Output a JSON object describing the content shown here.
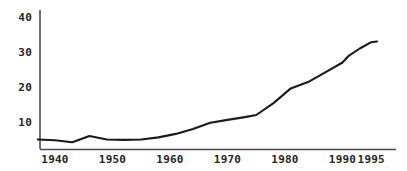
{
  "chart_data": {
    "type": "line",
    "title": "",
    "subtitle": "",
    "xlabel": "",
    "ylabel": "",
    "xlim": [
      1937,
      1997
    ],
    "ylim": [
      0,
      43
    ],
    "grid": false,
    "legend": null,
    "legend_position": "none",
    "line_color": "#1a1a1a",
    "axis_color": "#4a4a52",
    "background_color": "#ffffff",
    "x_ticks": [
      1940,
      1950,
      1960,
      1970,
      1980,
      1990,
      1995
    ],
    "x_tick_labels": [
      "1940",
      "1950",
      "1960",
      "1970",
      "1980",
      "1990",
      "1995"
    ],
    "y_ticks": [
      10,
      20,
      30,
      40
    ],
    "y_tick_labels": [
      "10",
      "20",
      "30",
      "40"
    ],
    "series": [
      {
        "name": "series-1",
        "x": [
          1937,
          1940,
          1943,
          1946,
          1949,
          1952,
          1955,
          1958,
          1961,
          1964,
          1967,
          1970,
          1973,
          1975,
          1978,
          1981,
          1984,
          1987,
          1990,
          1991,
          1993,
          1995,
          1996
        ],
        "values": [
          5.0,
          4.8,
          4.2,
          6.0,
          5.0,
          4.9,
          5.0,
          5.6,
          6.6,
          8.0,
          9.8,
          10.6,
          11.4,
          12.0,
          15.4,
          19.6,
          21.4,
          24.2,
          27.0,
          28.8,
          31.0,
          32.8,
          33.0
        ]
      }
    ]
  }
}
